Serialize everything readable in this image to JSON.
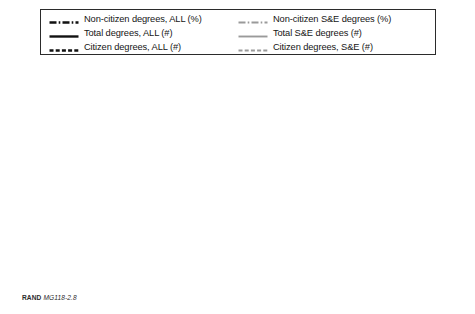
{
  "caption": {
    "publisher": "RAND",
    "code": "MG118-2.8"
  },
  "legend": {
    "left_column": [
      {
        "label": "Non-citizen degrees, ALL (%)",
        "style": "dash-dot",
        "color": "#111111"
      },
      {
        "label": "Total degrees, ALL (#)",
        "style": "solid",
        "color": "#111111"
      },
      {
        "label": "Citizen degrees, ALL (#)",
        "style": "dashed",
        "color": "#111111"
      }
    ],
    "right_column": [
      {
        "label": "Non-citizen S&E degrees (%)",
        "style": "dash-dot",
        "color": "#9a9a9a"
      },
      {
        "label": "Total S&E degrees (#)",
        "style": "solid",
        "color": "#9a9a9a"
      },
      {
        "label": "Citizen degrees, S&E (#)",
        "style": "dashed",
        "color": "#9a9a9a"
      }
    ]
  },
  "chart_data": {
    "type": "line",
    "title": "",
    "xlabel": "",
    "ylabel": "",
    "y2label": "",
    "grid": false,
    "legend_position": "top",
    "xlim": [
      1984,
      2000
    ],
    "xticks": [
      1984,
      1986,
      1988,
      1990,
      1992,
      1994,
      1996,
      1998,
      2000
    ],
    "xticklabels": [
      "1984",
      "1986",
      "1988",
      "1990",
      "1992",
      "1994",
      "1996",
      "1998",
      "2000"
    ],
    "ylim": [
      0,
      45
    ],
    "yticks": [
      0,
      5,
      10,
      15,
      20,
      25,
      30,
      35,
      40,
      45
    ],
    "yticklabels": [
      "0%",
      "5%",
      "10%",
      "15%",
      "20%",
      "25%",
      "30%",
      "35%",
      "40%",
      "45%"
    ],
    "y2lim": [
      0,
      45000
    ],
    "y2ticks": [
      0,
      5000,
      10000,
      15000,
      20000,
      25000,
      30000,
      35000,
      40000,
      45000
    ],
    "y2ticklabels": [
      "0",
      "5,000",
      "10,000",
      "15,000",
      "20,000",
      "25,000",
      "30,000",
      "35,000",
      "40,000",
      "45,000"
    ],
    "x": [
      1986,
      1987,
      1988,
      1989,
      1990,
      1991,
      1992,
      1993,
      1994,
      1995,
      1996,
      1997,
      1998,
      1999
    ],
    "series": [
      {
        "name": "Total degrees, ALL (#)",
        "axis": "right",
        "style": "solid",
        "color": "#111111",
        "width": 2.6,
        "values": [
          32.0,
          32.6,
          33.2,
          34.3,
          35.8,
          37.4,
          39.0,
          40.4,
          41.4,
          41.9,
          42.3,
          42.6,
          42.6,
          42.0
        ]
      },
      {
        "name": "Non-citizen S&E degrees (%)",
        "axis": "left",
        "style": "dash-dot",
        "color": "#9a9a9a",
        "width": 1.9,
        "values": [
          27.4,
          27.9,
          28.4,
          29.5,
          32.4,
          35.1,
          37.6,
          39.2,
          40.2,
          40.6,
          40.6,
          40.8,
          37.2,
          34.2
        ]
      },
      {
        "name": "Non-citizen degrees, ALL (%)",
        "axis": "left",
        "style": "dash-dot",
        "color": "#111111",
        "width": 2.4,
        "values": [
          22.0,
          22.7,
          23.4,
          24.0,
          25.4,
          27.6,
          29.5,
          30.6,
          30.8,
          30.5,
          31.1,
          31.2,
          28.5,
          28.3
        ]
      },
      {
        "name": "Citizen degrees, ALL (#)",
        "axis": "right",
        "style": "dashed",
        "color": "#111111",
        "width": 2.5,
        "values": [
          23.5,
          23.7,
          23.9,
          24.2,
          24.5,
          24.8,
          25.2,
          25.8,
          26.5,
          27.2,
          27.9,
          28.4,
          28.6,
          28.2
        ]
      },
      {
        "name": "Total S&E degrees (#)",
        "axis": "right",
        "style": "solid",
        "color": "#9a9a9a",
        "width": 1.9,
        "values": [
          20.4,
          20.6,
          20.9,
          21.3,
          22.2,
          23.1,
          24.0,
          24.8,
          25.6,
          26.4,
          27.2,
          27.8,
          27.9,
          27.0
        ]
      },
      {
        "name": "Citizen degrees, S&E (#)",
        "axis": "right",
        "style": "dashed",
        "color": "#9a9a9a",
        "width": 1.6,
        "values": [
          12.9,
          13.0,
          13.1,
          13.2,
          13.4,
          13.7,
          14.0,
          14.4,
          14.8,
          15.2,
          15.5,
          15.8,
          15.9,
          15.6
        ]
      }
    ]
  }
}
